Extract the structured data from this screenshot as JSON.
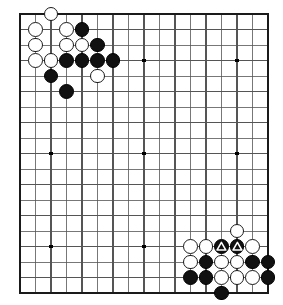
{
  "board": {
    "title": "Go board diagram",
    "type": "go-board",
    "cols": 17,
    "rows": 19,
    "cell": 15.5,
    "origin_x": 20,
    "origin_y": 14,
    "stone_radius": 7.4,
    "colors": {
      "background": "#ffffff",
      "line": "#555555",
      "border": "#1a1a1a",
      "black_stone": "#111111",
      "white_stone": "#ffffff",
      "star_point": "#000000",
      "mark": "#ffffff"
    },
    "edges": {
      "left": 20,
      "top": 14,
      "right": 268,
      "bottom": 294
    },
    "star_points": [
      {
        "col": 3,
        "row": 4
      },
      {
        "col": 9,
        "row": 4
      },
      {
        "col": 15,
        "row": 4
      },
      {
        "col": 3,
        "row": 10
      },
      {
        "col": 9,
        "row": 10
      },
      {
        "col": 15,
        "row": 10
      },
      {
        "col": 3,
        "row": 16
      },
      {
        "col": 9,
        "row": 16
      },
      {
        "col": 15,
        "row": 16
      }
    ],
    "stones": [
      {
        "col": 3,
        "row": 1,
        "color": "white",
        "mark": ""
      },
      {
        "col": 2,
        "row": 2,
        "color": "white",
        "mark": ""
      },
      {
        "col": 4,
        "row": 2,
        "color": "white",
        "mark": ""
      },
      {
        "col": 5,
        "row": 2,
        "color": "black",
        "mark": ""
      },
      {
        "col": 2,
        "row": 3,
        "color": "white",
        "mark": ""
      },
      {
        "col": 4,
        "row": 3,
        "color": "white",
        "mark": ""
      },
      {
        "col": 5,
        "row": 3,
        "color": "white",
        "mark": ""
      },
      {
        "col": 6,
        "row": 3,
        "color": "black",
        "mark": ""
      },
      {
        "col": 2,
        "row": 4,
        "color": "white",
        "mark": ""
      },
      {
        "col": 3,
        "row": 4,
        "color": "white",
        "mark": ""
      },
      {
        "col": 4,
        "row": 4,
        "color": "black",
        "mark": ""
      },
      {
        "col": 5,
        "row": 4,
        "color": "black",
        "mark": ""
      },
      {
        "col": 6,
        "row": 4,
        "color": "black",
        "mark": ""
      },
      {
        "col": 7,
        "row": 4,
        "color": "black",
        "mark": ""
      },
      {
        "col": 3,
        "row": 5,
        "color": "black",
        "mark": ""
      },
      {
        "col": 6,
        "row": 5,
        "color": "white",
        "mark": ""
      },
      {
        "col": 4,
        "row": 6,
        "color": "black",
        "mark": ""
      },
      {
        "col": 15,
        "row": 15,
        "color": "white",
        "mark": ""
      },
      {
        "col": 12,
        "row": 16,
        "color": "white",
        "mark": ""
      },
      {
        "col": 13,
        "row": 16,
        "color": "white",
        "mark": ""
      },
      {
        "col": 14,
        "row": 16,
        "color": "black",
        "mark": "triangle"
      },
      {
        "col": 15,
        "row": 16,
        "color": "black",
        "mark": "triangle"
      },
      {
        "col": 16,
        "row": 16,
        "color": "white",
        "mark": ""
      },
      {
        "col": 12,
        "row": 17,
        "color": "white",
        "mark": ""
      },
      {
        "col": 13,
        "row": 17,
        "color": "black",
        "mark": ""
      },
      {
        "col": 14,
        "row": 17,
        "color": "white",
        "mark": ""
      },
      {
        "col": 15,
        "row": 17,
        "color": "white",
        "mark": ""
      },
      {
        "col": 16,
        "row": 17,
        "color": "black",
        "mark": ""
      },
      {
        "col": 17,
        "row": 17,
        "color": "black",
        "mark": ""
      },
      {
        "col": 12,
        "row": 18,
        "color": "black",
        "mark": ""
      },
      {
        "col": 13,
        "row": 18,
        "color": "black",
        "mark": ""
      },
      {
        "col": 14,
        "row": 18,
        "color": "white",
        "mark": ""
      },
      {
        "col": 15,
        "row": 18,
        "color": "white",
        "mark": ""
      },
      {
        "col": 16,
        "row": 18,
        "color": "white",
        "mark": ""
      },
      {
        "col": 17,
        "row": 18,
        "color": "black",
        "mark": ""
      },
      {
        "col": 14,
        "row": 19,
        "color": "black",
        "mark": ""
      }
    ]
  }
}
